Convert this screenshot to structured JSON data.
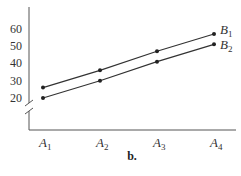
{
  "chart_data": {
    "type": "line",
    "title": "",
    "caption": "b.",
    "xlabel": "",
    "ylabel": "",
    "categories": [
      "A1",
      "A2",
      "A3",
      "A4"
    ],
    "category_labels": [
      {
        "base": "A",
        "sub": "1"
      },
      {
        "base": "A",
        "sub": "2"
      },
      {
        "base": "A",
        "sub": "3"
      },
      {
        "base": "A",
        "sub": "4"
      }
    ],
    "yticks": [
      20,
      30,
      40,
      50,
      60
    ],
    "ylim": [
      20,
      60
    ],
    "axis_break": true,
    "grid": false,
    "legend_position": "inline-right",
    "series": [
      {
        "name": "B1",
        "label_base": "B",
        "label_sub": "1",
        "values": [
          26,
          36,
          47,
          57
        ]
      },
      {
        "name": "B2",
        "label_base": "B",
        "label_sub": "2",
        "values": [
          20,
          30,
          41,
          51
        ]
      }
    ]
  }
}
